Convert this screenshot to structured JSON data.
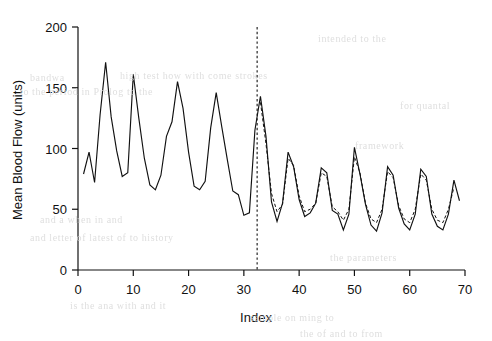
{
  "figure": {
    "background_color": "#ffffff",
    "ink_color": "#111111",
    "bleed_through_color": "#d9d9d9"
  },
  "bleed_through_text": [
    {
      "text": "intended to the",
      "x": 318,
      "y": 33
    },
    {
      "text": "bandwa",
      "x": 30,
      "y": 72
    },
    {
      "text": "high test how with come strokes",
      "x": 120,
      "y": 70
    },
    {
      "text": "to the   period  in Prolog to the",
      "x": 20,
      "y": 86
    },
    {
      "text": "for  quantal",
      "x": 400,
      "y": 100
    },
    {
      "text": "framework",
      "x": 355,
      "y": 140
    },
    {
      "text": "and a  when in  and",
      "x": 40,
      "y": 214
    },
    {
      "text": "and letter   of  latest  of  to history",
      "x": 30,
      "y": 232
    },
    {
      "text": "the  parameters",
      "x": 330,
      "y": 252
    },
    {
      "text": "is the  ana with  and  it",
      "x": 70,
      "y": 300
    },
    {
      "text": "sample  on ming to",
      "x": 250,
      "y": 312
    },
    {
      "text": "the of   and  to from",
      "x": 300,
      "y": 328
    }
  ],
  "chart_data": {
    "type": "line",
    "title": "",
    "subtitle": "",
    "xlabel": "Index",
    "ylabel": "Mean Blood Flow (units)",
    "xlim": [
      0,
      70
    ],
    "ylim": [
      0,
      200
    ],
    "xticks": [
      0,
      10,
      20,
      30,
      40,
      50,
      60,
      70
    ],
    "xtick_labels": [
      "0",
      "10",
      "20",
      "30",
      "40",
      "50",
      "60",
      "70"
    ],
    "yticks": [
      0,
      50,
      100,
      150,
      200
    ],
    "ytick_labels": [
      "0",
      "50",
      "100",
      "150",
      "200"
    ],
    "grid": false,
    "legend": false,
    "legend_position": "none",
    "annotations": [
      {
        "name": "forecast-origin-line",
        "type": "vline",
        "x": 32.4,
        "style": "dashed",
        "label": ""
      }
    ],
    "series": [
      {
        "name": "Observed",
        "style": "solid",
        "color": "#111111",
        "x": [
          1,
          2,
          3,
          4,
          5,
          6,
          7,
          8,
          9,
          10,
          11,
          12,
          13,
          14,
          15,
          16,
          17,
          18,
          19,
          20,
          21,
          22,
          23,
          24,
          25,
          26,
          27,
          28,
          29,
          30,
          31,
          32,
          33,
          34,
          35,
          36,
          37,
          38,
          39,
          40,
          41,
          42,
          43,
          44,
          45,
          46,
          47,
          48,
          49,
          50,
          51,
          52,
          53,
          54,
          55,
          56,
          57,
          58,
          59,
          60,
          61,
          62,
          63,
          64,
          65,
          66,
          67,
          68,
          69
        ],
        "values": [
          79,
          97,
          72,
          128,
          171,
          126,
          98,
          77,
          80,
          161,
          125,
          92,
          70,
          66,
          78,
          110,
          122,
          155,
          133,
          97,
          69,
          66,
          73,
          117,
          146,
          118,
          91,
          65,
          62,
          45,
          47,
          115,
          143,
          110,
          56,
          40,
          55,
          97,
          85,
          58,
          44,
          47,
          55,
          84,
          80,
          49,
          46,
          33,
          46,
          101,
          79,
          54,
          37,
          32,
          47,
          85,
          78,
          51,
          38,
          33,
          46,
          83,
          77,
          46,
          36,
          33,
          46,
          74,
          57
        ]
      },
      {
        "name": "Fitted / Forecast",
        "style": "dashed",
        "color": "#111111",
        "x": [
          33,
          34,
          35,
          36,
          37,
          38,
          39,
          40,
          41,
          42,
          43,
          44,
          45,
          46,
          47,
          48,
          49,
          50,
          51,
          52,
          53,
          54,
          55,
          56,
          57,
          58,
          59,
          60,
          61,
          62,
          63,
          64,
          65,
          66,
          67,
          68
        ],
        "values": [
          138,
          104,
          63,
          48,
          54,
          92,
          86,
          61,
          48,
          50,
          55,
          80,
          77,
          52,
          48,
          41,
          50,
          93,
          80,
          55,
          42,
          39,
          50,
          81,
          76,
          53,
          42,
          39,
          50,
          79,
          74,
          50,
          41,
          39,
          50,
          68
        ]
      }
    ]
  },
  "axis_geometry": {
    "plot_left_px": 78,
    "plot_right_px": 465,
    "plot_top_px": 27,
    "plot_bottom_px": 270
  }
}
